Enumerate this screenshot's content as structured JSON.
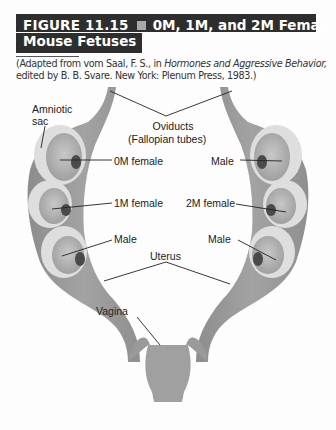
{
  "figure": {
    "number": "FIGURE 11.15",
    "title_part1": "0M, 1M, and 2M Female",
    "title_part2": "Mouse Fetuses",
    "colors": {
      "title_bg": "#2e2e2e",
      "title_text": "#ffffff",
      "separator": "#a9a9a9",
      "tissue": "#9a9a9a",
      "sac": "#d9d9d9"
    }
  },
  "caption": {
    "prefix": "(Adapted from vom Saal, F. S., in ",
    "italic": "Hormones and Aggressive Behavior,",
    "line2": "edited by B. B. Svare. New York: Plenum Press, 1983.)"
  },
  "labels": {
    "amniotic_sac_1": "Amniotic",
    "amniotic_sac_2": "sac",
    "oviducts_1": "Oviducts",
    "oviducts_2": "(Fallopian tubes)",
    "left_top": "0M female",
    "left_mid": "1M female",
    "left_bot": "Male",
    "right_top": "Male",
    "right_mid": "2M female",
    "right_bot": "Male",
    "uterus": "Uterus",
    "vagina": "Vagina"
  }
}
